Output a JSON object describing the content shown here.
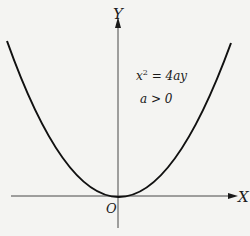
{
  "diagram": {
    "type": "parabola",
    "axes": {
      "x_label": "X",
      "y_label": "Y",
      "origin_label": "O"
    },
    "equation": {
      "base": "x",
      "exponent": "2",
      "rhs": " = 4ay"
    },
    "condition": "a > 0",
    "colors": {
      "background": "#f4f4f2",
      "ink": "#1a1a1a"
    }
  }
}
